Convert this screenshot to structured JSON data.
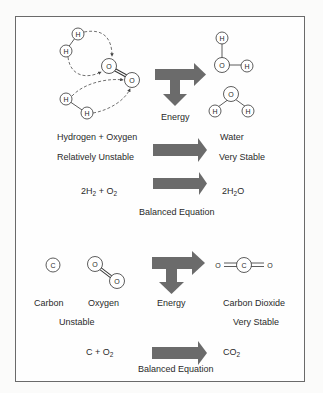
{
  "colors": {
    "arrow": "#6b6b6b",
    "frame": "#6a6a6a",
    "text": "#2a2a2a"
  },
  "panel1": {
    "energy_label": "Energy",
    "reactants_label": "Hydrogen + Oxygen",
    "reactants_stability": "Relatively Unstable",
    "products_label": "Water",
    "products_stability": "Very Stable",
    "equation_left": [
      "2H",
      "2",
      " + O",
      "2"
    ],
    "equation_right": [
      "2H",
      "2",
      "O"
    ],
    "equation_caption": "Balanced Equation",
    "atoms": {
      "hydrogen": "H",
      "oxygen": "O"
    }
  },
  "panel2": {
    "carbon_label": "Carbon",
    "oxygen_label": "Oxygen",
    "energy_label": "Energy",
    "product_label": "Carbon Dioxide",
    "reactants_stability": "Unstable",
    "products_stability": "Very Stable",
    "equation_left": [
      "C + O",
      "2"
    ],
    "equation_right": [
      "CO",
      "2"
    ],
    "equation_caption": "Balanced Equation",
    "atoms": {
      "carbon": "C",
      "oxygen": "O"
    }
  }
}
